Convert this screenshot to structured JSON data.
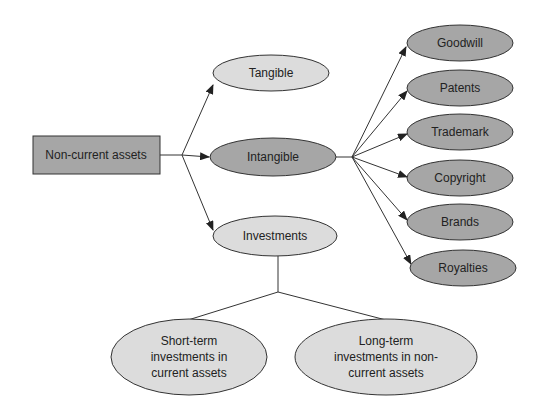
{
  "diagram": {
    "root": {
      "label": "Non-current assets",
      "fill": "#a6a6a6"
    },
    "level1": [
      {
        "label": "Tangible",
        "fill": "#dcdcdc"
      },
      {
        "label": "Intangible",
        "fill": "#a6a6a6"
      },
      {
        "label": "Investments",
        "fill": "#dcdcdc"
      }
    ],
    "intangible_children": [
      {
        "label": "Goodwill"
      },
      {
        "label": "Patents"
      },
      {
        "label": "Trademark"
      },
      {
        "label": "Copyright"
      },
      {
        "label": "Brands"
      },
      {
        "label": "Royalties"
      }
    ],
    "investment_children": [
      {
        "lines": [
          "Short-term",
          "investments in",
          "current assets"
        ]
      },
      {
        "lines": [
          "Long-term",
          "investments in non-",
          "current assets"
        ]
      }
    ],
    "colors": {
      "dark_fill": "#a6a6a6",
      "light_fill": "#dcdcdc",
      "stroke": "#333333",
      "text": "#222222"
    }
  }
}
